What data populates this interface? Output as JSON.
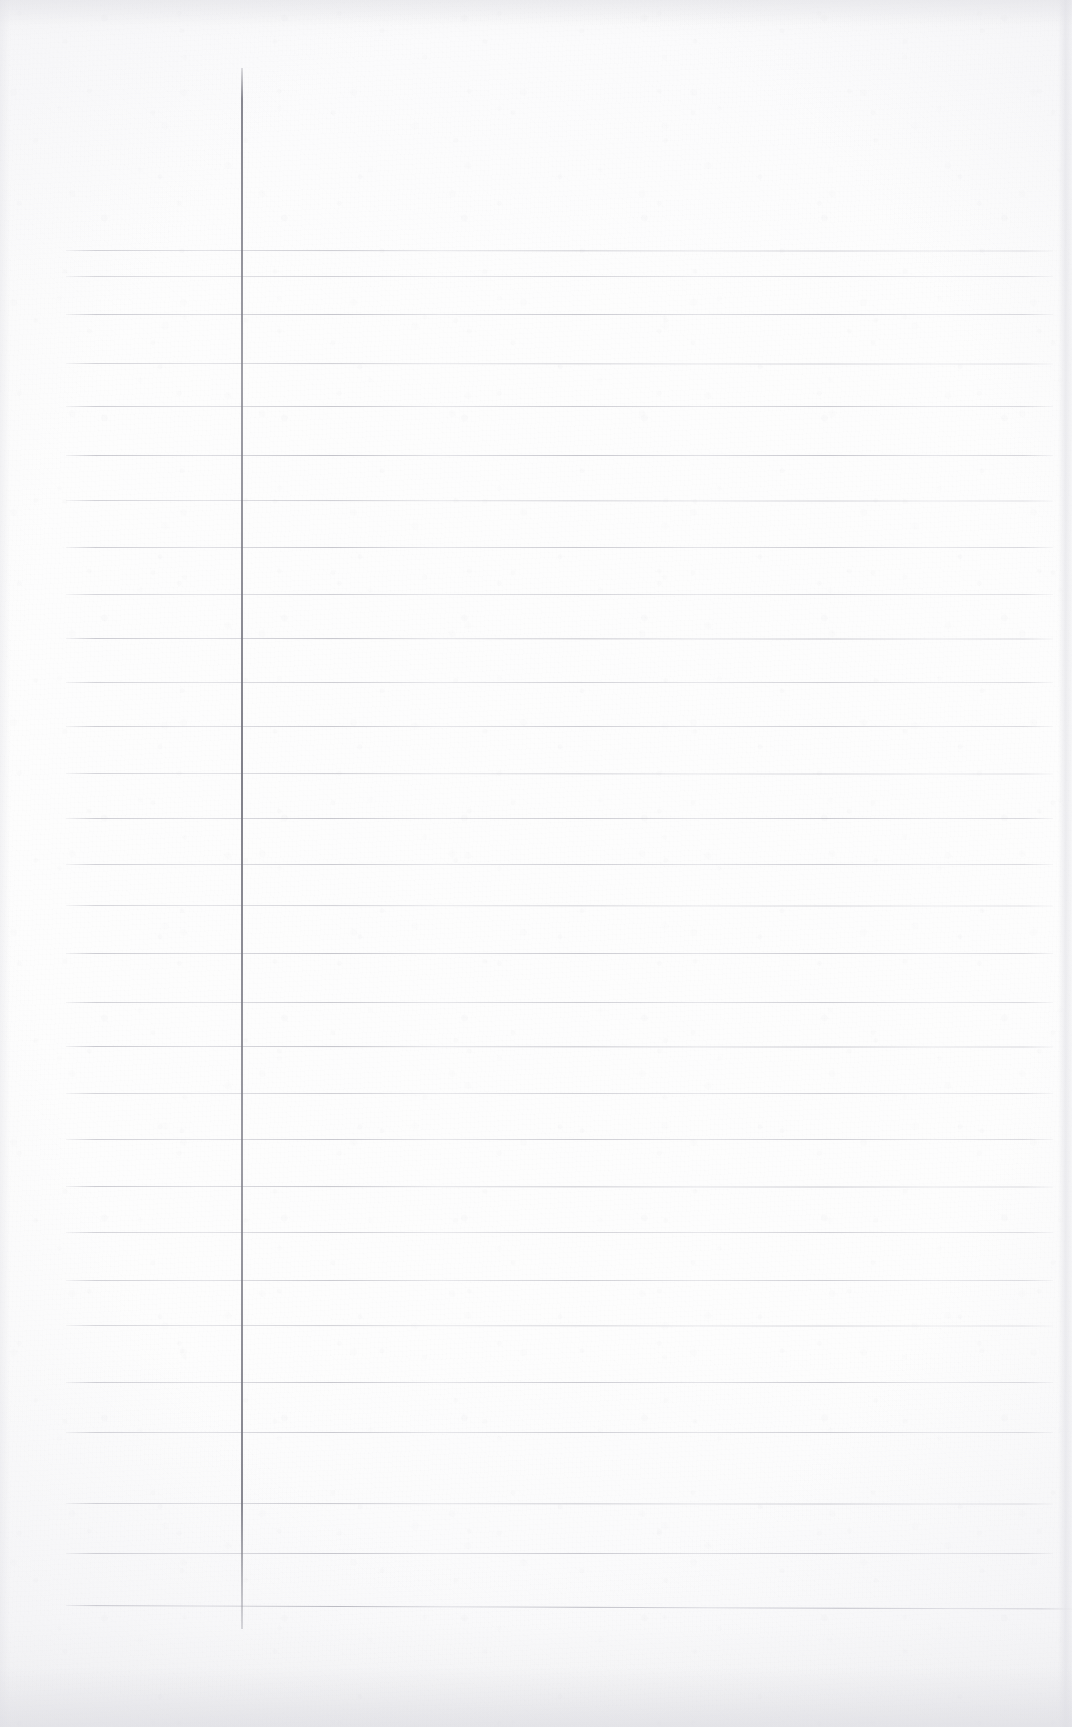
{
  "document": {
    "kind": "scanned-lined-paper",
    "content_text": "",
    "width": 1072,
    "height": 1727
  },
  "colors": {
    "paper": "#fcfcfc",
    "paper_shade": "#f2f2f4",
    "rule_line": "#b4b4be",
    "margin_line": "#7c7c86",
    "edge_shadow": "#e2e2e8"
  },
  "layout": {
    "margin_line": {
      "x": 241,
      "top": 68,
      "bottom": 1629,
      "width": 2
    },
    "rules": {
      "count": 29,
      "first_y": 250,
      "spacing": 48.4,
      "left_x": 66,
      "right_x": 1053,
      "last_rule_left_x": 66,
      "last_rule_right_x": 1072
    }
  },
  "rule_lines": [
    {
      "y": 250,
      "left": 66,
      "right": 1053,
      "opacity": 0.62
    },
    {
      "y": 276,
      "left": 66,
      "right": 1053,
      "opacity": 0.55
    },
    {
      "y": 314,
      "left": 66,
      "right": 1053,
      "opacity": 0.7
    },
    {
      "y": 363,
      "left": 66,
      "right": 1053,
      "opacity": 0.58
    },
    {
      "y": 406,
      "left": 66,
      "right": 1053,
      "opacity": 0.66
    },
    {
      "y": 455,
      "left": 66,
      "right": 1053,
      "opacity": 0.74
    },
    {
      "y": 500,
      "left": 66,
      "right": 1053,
      "opacity": 0.6
    },
    {
      "y": 547,
      "left": 66,
      "right": 1053,
      "opacity": 0.68
    },
    {
      "y": 594,
      "left": 66,
      "right": 1053,
      "opacity": 0.56
    },
    {
      "y": 638,
      "left": 66,
      "right": 1053,
      "opacity": 0.72
    },
    {
      "y": 682,
      "left": 66,
      "right": 1053,
      "opacity": 0.6
    },
    {
      "y": 726,
      "left": 66,
      "right": 1053,
      "opacity": 0.64
    },
    {
      "y": 773,
      "left": 66,
      "right": 1053,
      "opacity": 0.58
    },
    {
      "y": 818,
      "left": 66,
      "right": 1053,
      "opacity": 0.68
    },
    {
      "y": 864,
      "left": 66,
      "right": 1053,
      "opacity": 0.62
    },
    {
      "y": 905,
      "left": 66,
      "right": 1053,
      "opacity": 0.56
    },
    {
      "y": 953,
      "left": 66,
      "right": 1053,
      "opacity": 0.7
    },
    {
      "y": 1002,
      "left": 66,
      "right": 1053,
      "opacity": 0.64
    },
    {
      "y": 1046,
      "left": 66,
      "right": 1053,
      "opacity": 0.74
    },
    {
      "y": 1093,
      "left": 66,
      "right": 1053,
      "opacity": 0.58
    },
    {
      "y": 1139,
      "left": 66,
      "right": 1053,
      "opacity": 0.66
    },
    {
      "y": 1186,
      "left": 66,
      "right": 1053,
      "opacity": 0.7
    },
    {
      "y": 1232,
      "left": 66,
      "right": 1053,
      "opacity": 0.6
    },
    {
      "y": 1280,
      "left": 66,
      "right": 1053,
      "opacity": 0.62
    },
    {
      "y": 1325,
      "left": 66,
      "right": 1053,
      "opacity": 0.56
    },
    {
      "y": 1382,
      "left": 66,
      "right": 1053,
      "opacity": 0.68
    },
    {
      "y": 1432,
      "left": 66,
      "right": 1053,
      "opacity": 0.64
    },
    {
      "y": 1503,
      "left": 66,
      "right": 1053,
      "opacity": 0.66
    },
    {
      "y": 1553,
      "left": 66,
      "right": 1053,
      "opacity": 0.7
    },
    {
      "y": 1605,
      "left": 66,
      "right": 1072,
      "opacity": 0.86
    }
  ]
}
